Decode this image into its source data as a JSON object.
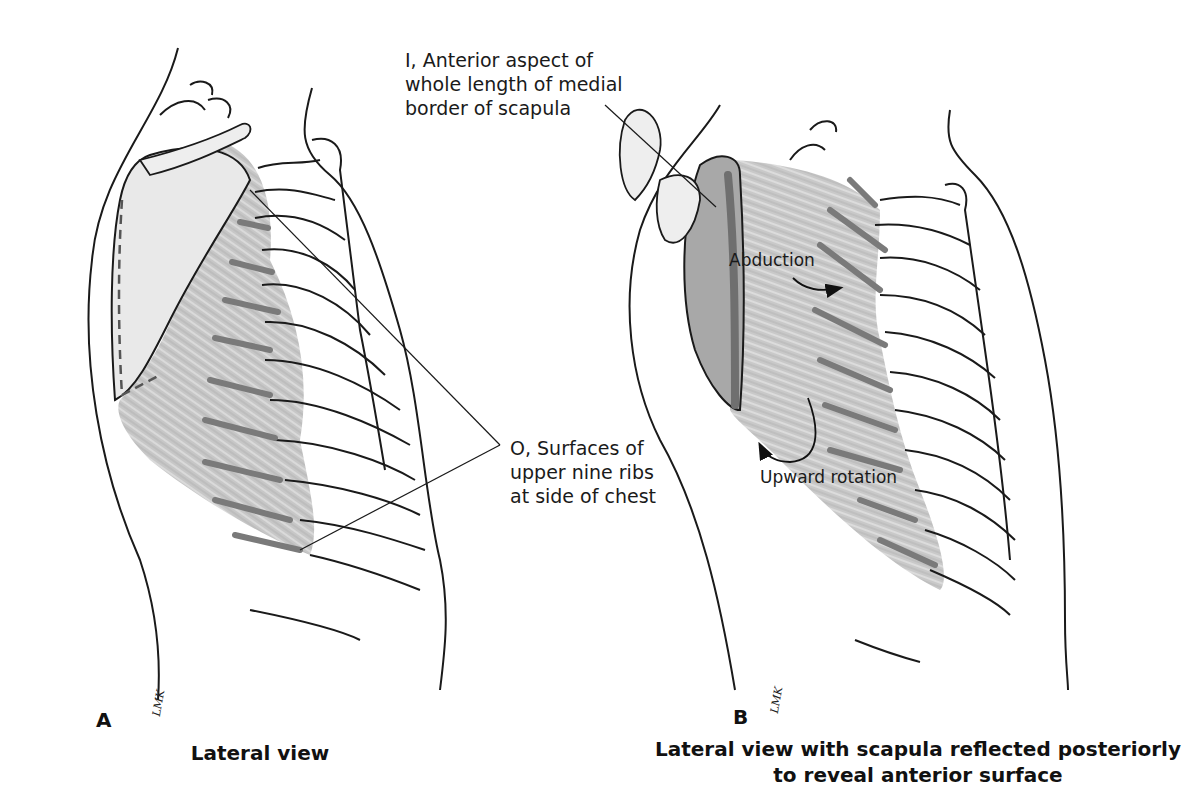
{
  "figure": {
    "panels": [
      {
        "id": "A",
        "letter": "A",
        "caption": "Lateral view",
        "signature": "LMK"
      },
      {
        "id": "B",
        "letter": "B",
        "caption": "Lateral view with scapula reflected posteriorly\nto reveal anterior surface",
        "signature": "LMK"
      }
    ],
    "labels": {
      "insertion": "I, Anterior aspect of\nwhole length of medial\nborder of scapula",
      "origin": "O, Surfaces of\nupper nine ribs\nat side of chest"
    },
    "actions": {
      "abduction": "Abduction",
      "upward_rotation": "Upward rotation"
    },
    "colors": {
      "line": "#1a1a1a",
      "muscle": "#b9b9b9",
      "muscle_attachment": "#7a7a7a",
      "bone_shade": "#d8d8d8",
      "background": "#ffffff"
    }
  }
}
